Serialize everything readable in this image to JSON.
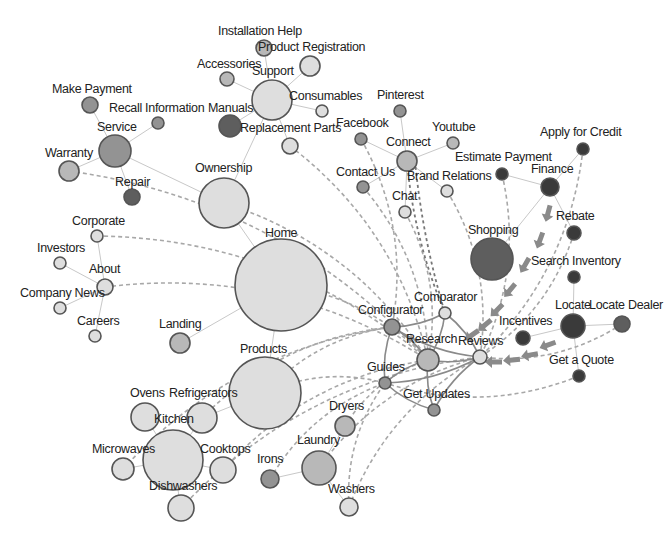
{
  "colors": {
    "light": "#dedede",
    "mid": "#b8b8b8",
    "midDark": "#939393",
    "dark": "#5e5e5e",
    "darkest": "#3a3a3a",
    "stroke": "#555555",
    "edge": "#c8c8c8",
    "dashed": "#a8a8a8"
  },
  "nodes": [
    {
      "id": "installation-help",
      "label": "Installation Help",
      "x": 264,
      "y": 48,
      "r": 8,
      "shade": "mid",
      "lx": 218,
      "ly": 35
    },
    {
      "id": "product-registration",
      "label": "Product Registration",
      "x": 310,
      "y": 66,
      "r": 10,
      "shade": "light",
      "lx": 258,
      "ly": 51
    },
    {
      "id": "accessories",
      "label": "Accessories",
      "x": 227,
      "y": 79,
      "r": 7,
      "shade": "mid",
      "lx": 197,
      "ly": 68
    },
    {
      "id": "support",
      "label": "Support",
      "x": 272,
      "y": 100,
      "r": 20,
      "shade": "light",
      "lx": 252,
      "ly": 75
    },
    {
      "id": "consumables",
      "label": "Consumables",
      "x": 322,
      "y": 111,
      "r": 6,
      "shade": "light",
      "lx": 289,
      "ly": 100
    },
    {
      "id": "manuals",
      "label": "Manuals",
      "x": 230,
      "y": 126,
      "r": 11,
      "shade": "dark",
      "lx": 208,
      "ly": 112
    },
    {
      "id": "replacement-parts",
      "label": "Replacement Parts",
      "x": 290,
      "y": 146,
      "r": 8,
      "shade": "light",
      "lx": 240,
      "ly": 132
    },
    {
      "id": "make-payment",
      "label": "Make Payment",
      "x": 90,
      "y": 105,
      "r": 8,
      "shade": "midDark",
      "lx": 52,
      "ly": 93
    },
    {
      "id": "recall-information",
      "label": "Recall Information",
      "x": 158,
      "y": 123,
      "r": 6,
      "shade": "midDark",
      "lx": 109,
      "ly": 112
    },
    {
      "id": "service",
      "label": "Service",
      "x": 115,
      "y": 151,
      "r": 16,
      "shade": "midDark",
      "lx": 97,
      "ly": 131
    },
    {
      "id": "warranty",
      "label": "Warranty",
      "x": 69,
      "y": 171,
      "r": 10,
      "shade": "mid",
      "lx": 45,
      "ly": 157
    },
    {
      "id": "repair",
      "label": "Repair",
      "x": 132,
      "y": 197,
      "r": 8,
      "shade": "dark",
      "lx": 115,
      "ly": 186
    },
    {
      "id": "ownership",
      "label": "Ownership",
      "x": 224,
      "y": 203,
      "r": 25,
      "shade": "light",
      "lx": 195,
      "ly": 172
    },
    {
      "id": "corporate",
      "label": "Corporate",
      "x": 97,
      "y": 236,
      "r": 6,
      "shade": "light",
      "lx": 72,
      "ly": 225
    },
    {
      "id": "investors",
      "label": "Investors",
      "x": 60,
      "y": 263,
      "r": 6,
      "shade": "light",
      "lx": 37,
      "ly": 252
    },
    {
      "id": "about",
      "label": "About",
      "x": 105,
      "y": 287,
      "r": 8,
      "shade": "light",
      "lx": 89,
      "ly": 273
    },
    {
      "id": "company-news",
      "label": "Company News",
      "x": 60,
      "y": 308,
      "r": 6,
      "shade": "light",
      "lx": 20,
      "ly": 297
    },
    {
      "id": "careers",
      "label": "Careers",
      "x": 95,
      "y": 336,
      "r": 6,
      "shade": "light",
      "lx": 77,
      "ly": 325
    },
    {
      "id": "home",
      "label": "Home",
      "x": 281,
      "y": 285,
      "r": 46,
      "shade": "light",
      "lx": 265,
      "ly": 237
    },
    {
      "id": "landing",
      "label": "Landing",
      "x": 180,
      "y": 343,
      "r": 10,
      "shade": "mid",
      "lx": 159,
      "ly": 328
    },
    {
      "id": "products",
      "label": "Products",
      "x": 265,
      "y": 393,
      "r": 36,
      "shade": "light",
      "lx": 240,
      "ly": 353
    },
    {
      "id": "ovens",
      "label": "Ovens",
      "x": 145,
      "y": 417,
      "r": 14,
      "shade": "light",
      "lx": 130,
      "ly": 397
    },
    {
      "id": "refrigerators",
      "label": "Refrigerators",
      "x": 202,
      "y": 418,
      "r": 15,
      "shade": "light",
      "lx": 169,
      "ly": 397
    },
    {
      "id": "kitchen",
      "label": "Kitchen",
      "x": 173,
      "y": 460,
      "r": 30,
      "shade": "light",
      "lx": 154,
      "ly": 423
    },
    {
      "id": "microwaves",
      "label": "Microwaves",
      "x": 123,
      "y": 469,
      "r": 11,
      "shade": "light",
      "lx": 92,
      "ly": 453
    },
    {
      "id": "cooktops",
      "label": "Cooktops",
      "x": 223,
      "y": 470,
      "r": 13,
      "shade": "light",
      "lx": 200,
      "ly": 453
    },
    {
      "id": "irons",
      "label": "Irons",
      "x": 270,
      "y": 479,
      "r": 9,
      "shade": "midDark",
      "lx": 257,
      "ly": 463
    },
    {
      "id": "dishwashers",
      "label": "Dishwashers",
      "x": 181,
      "y": 508,
      "r": 13,
      "shade": "light",
      "lx": 149,
      "ly": 490
    },
    {
      "id": "laundry",
      "label": "Laundry",
      "x": 319,
      "y": 468,
      "r": 17,
      "shade": "mid",
      "lx": 297,
      "ly": 444
    },
    {
      "id": "dryers",
      "label": "Dryers",
      "x": 345,
      "y": 426,
      "r": 10,
      "shade": "mid",
      "lx": 329,
      "ly": 410
    },
    {
      "id": "washers",
      "label": "Washers",
      "x": 349,
      "y": 507,
      "r": 9,
      "shade": "light",
      "lx": 328,
      "ly": 493
    },
    {
      "id": "pinterest",
      "label": "Pinterest",
      "x": 400,
      "y": 111,
      "r": 6,
      "shade": "midDark",
      "lx": 377,
      "ly": 99
    },
    {
      "id": "facebook",
      "label": "Facebook",
      "x": 361,
      "y": 139,
      "r": 6,
      "shade": "midDark",
      "lx": 336,
      "ly": 127
    },
    {
      "id": "youtube",
      "label": "Youtube",
      "x": 453,
      "y": 143,
      "r": 6,
      "shade": "mid",
      "lx": 432,
      "ly": 131
    },
    {
      "id": "connect",
      "label": "Connect",
      "x": 407,
      "y": 161,
      "r": 10,
      "shade": "mid",
      "lx": 386,
      "ly": 146
    },
    {
      "id": "contact-us",
      "label": "Contact Us",
      "x": 363,
      "y": 187,
      "r": 6,
      "shade": "midDark",
      "lx": 336,
      "ly": 176
    },
    {
      "id": "brand-relations",
      "label": "Brand Relations",
      "x": 447,
      "y": 191,
      "r": 6,
      "shade": "light",
      "lx": 407,
      "ly": 180
    },
    {
      "id": "chat",
      "label": "Chat",
      "x": 405,
      "y": 212,
      "r": 6,
      "shade": "light",
      "lx": 392,
      "ly": 200
    },
    {
      "id": "estimate-payment",
      "label": "Estimate Payment",
      "x": 502,
      "y": 174,
      "r": 6,
      "shade": "darkest",
      "lx": 455,
      "ly": 161
    },
    {
      "id": "finance",
      "label": "Finance",
      "x": 550,
      "y": 187,
      "r": 9,
      "shade": "darkest",
      "lx": 531,
      "ly": 173
    },
    {
      "id": "apply-for-credit",
      "label": "Apply for Credit",
      "x": 583,
      "y": 149,
      "r": 6,
      "shade": "darkest",
      "lx": 540,
      "ly": 136
    },
    {
      "id": "shopping",
      "label": "Shopping",
      "x": 492,
      "y": 259,
      "r": 21,
      "shade": "dark",
      "lx": 468,
      "ly": 234
    },
    {
      "id": "rebate",
      "label": "Rebate",
      "x": 574,
      "y": 233,
      "r": 7,
      "shade": "darkest",
      "lx": 556,
      "ly": 220
    },
    {
      "id": "search-inventory",
      "label": "Search Inventory",
      "x": 574,
      "y": 277,
      "r": 6,
      "shade": "darkest",
      "lx": 531,
      "ly": 265
    },
    {
      "id": "locate",
      "label": "Locate",
      "x": 573,
      "y": 326,
      "r": 12,
      "shade": "darkest",
      "lx": 555,
      "ly": 309
    },
    {
      "id": "locate-dealer",
      "label": "Locate Dealer",
      "x": 622,
      "y": 324,
      "r": 8,
      "shade": "dark",
      "lx": 589,
      "ly": 309
    },
    {
      "id": "incentives",
      "label": "Incentives",
      "x": 523,
      "y": 338,
      "r": 7,
      "shade": "darkest",
      "lx": 499,
      "ly": 325
    },
    {
      "id": "get-a-quote",
      "label": "Get a Quote",
      "x": 579,
      "y": 376,
      "r": 6,
      "shade": "darkest",
      "lx": 549,
      "ly": 364
    },
    {
      "id": "comparator",
      "label": "Comparator",
      "x": 445,
      "y": 313,
      "r": 6,
      "shade": "light",
      "lx": 414,
      "ly": 301
    },
    {
      "id": "configurator",
      "label": "Configurator",
      "x": 392,
      "y": 327,
      "r": 8,
      "shade": "midDark",
      "lx": 358,
      "ly": 314
    },
    {
      "id": "research",
      "label": "Research",
      "x": 428,
      "y": 360,
      "r": 11,
      "shade": "mid",
      "lx": 406,
      "ly": 343
    },
    {
      "id": "reviews",
      "label": "Reviews",
      "x": 480,
      "y": 357,
      "r": 7,
      "shade": "light",
      "lx": 458,
      "ly": 345
    },
    {
      "id": "guides",
      "label": "Guides",
      "x": 385,
      "y": 383,
      "r": 6,
      "shade": "midDark",
      "lx": 367,
      "ly": 371
    },
    {
      "id": "get-updates",
      "label": "Get Updates",
      "x": 434,
      "y": 410,
      "r": 6,
      "shade": "midDark",
      "lx": 403,
      "ly": 398
    }
  ],
  "edges": [
    [
      "support",
      "installation-help"
    ],
    [
      "support",
      "product-registration"
    ],
    [
      "support",
      "accessories"
    ],
    [
      "support",
      "consumables"
    ],
    [
      "support",
      "manuals"
    ],
    [
      "support",
      "replacement-parts"
    ],
    [
      "ownership",
      "support"
    ],
    [
      "ownership",
      "service"
    ],
    [
      "service",
      "make-payment"
    ],
    [
      "service",
      "recall-information"
    ],
    [
      "service",
      "warranty"
    ],
    [
      "service",
      "repair"
    ],
    [
      "home",
      "ownership"
    ],
    [
      "home",
      "landing"
    ],
    [
      "home",
      "products"
    ],
    [
      "about",
      "corporate"
    ],
    [
      "about",
      "investors"
    ],
    [
      "about",
      "company-news"
    ],
    [
      "about",
      "careers"
    ],
    [
      "connect",
      "pinterest"
    ],
    [
      "connect",
      "facebook"
    ],
    [
      "connect",
      "youtube"
    ],
    [
      "connect",
      "contact-us"
    ],
    [
      "connect",
      "brand-relations"
    ],
    [
      "connect",
      "chat"
    ],
    [
      "finance",
      "estimate-payment"
    ],
    [
      "finance",
      "apply-for-credit"
    ],
    [
      "finance",
      "rebate"
    ],
    [
      "shopping",
      "finance"
    ],
    [
      "locate",
      "search-inventory"
    ],
    [
      "locate",
      "locate-dealer"
    ],
    [
      "locate",
      "get-a-quote"
    ],
    [
      "locate",
      "incentives"
    ],
    [
      "products",
      "refrigerators"
    ],
    [
      "refrigerators",
      "kitchen"
    ],
    [
      "ovens",
      "kitchen"
    ],
    [
      "microwaves",
      "kitchen"
    ],
    [
      "kitchen",
      "cooktops"
    ],
    [
      "kitchen",
      "dishwashers"
    ],
    [
      "laundry",
      "irons"
    ],
    [
      "laundry",
      "dryers"
    ],
    [
      "laundry",
      "washers"
    ]
  ],
  "hub_edges": [
    [
      "research",
      "configurator"
    ],
    [
      "research",
      "comparator"
    ],
    [
      "research",
      "reviews"
    ],
    [
      "research",
      "guides"
    ],
    [
      "research",
      "get-updates"
    ],
    [
      "configurator",
      "comparator"
    ],
    [
      "configurator",
      "guides"
    ],
    [
      "reviews",
      "comparator"
    ],
    [
      "reviews",
      "get-updates"
    ],
    [
      "guides",
      "get-updates"
    ],
    [
      "configurator",
      "reviews"
    ],
    [
      "guides",
      "reviews"
    ]
  ],
  "dashed_edges": [
    [
      "warranty",
      "research"
    ],
    [
      "ownership",
      "research"
    ],
    [
      "corporate",
      "research"
    ],
    [
      "about",
      "research"
    ],
    [
      "home",
      "research"
    ],
    [
      "replacement-parts",
      "research"
    ],
    [
      "facebook",
      "configurator"
    ],
    [
      "contact-us",
      "research"
    ],
    [
      "chat",
      "research"
    ],
    [
      "brand-relations",
      "reviews"
    ],
    [
      "estimate-payment",
      "reviews"
    ],
    [
      "apply-for-credit",
      "reviews"
    ],
    [
      "rebate",
      "reviews"
    ],
    [
      "locate-dealer",
      "reviews"
    ],
    [
      "get-a-quote",
      "guides"
    ],
    [
      "refrigerators",
      "configurator"
    ],
    [
      "products",
      "configurator"
    ],
    [
      "products",
      "guides"
    ],
    [
      "cooktops",
      "research"
    ],
    [
      "dishwashers",
      "reviews"
    ],
    [
      "irons",
      "guides"
    ],
    [
      "dryers",
      "research"
    ],
    [
      "laundry",
      "reviews"
    ],
    [
      "washers",
      "guides"
    ],
    [
      "washers",
      "reviews"
    ],
    [
      "microwaves",
      "configurator"
    ]
  ],
  "dark_dashed_edges": [
    [
      "connect",
      "comparator"
    ]
  ],
  "arrows": [
    {
      "x": 548,
      "y": 213,
      "angle": 105
    },
    {
      "x": 540,
      "y": 240,
      "angle": 110
    },
    {
      "x": 525,
      "y": 265,
      "angle": 120
    },
    {
      "x": 510,
      "y": 290,
      "angle": 130
    },
    {
      "x": 497,
      "y": 310,
      "angle": 135
    },
    {
      "x": 485,
      "y": 325,
      "angle": 140
    },
    {
      "x": 472,
      "y": 335,
      "angle": 145
    },
    {
      "x": 548,
      "y": 345,
      "angle": 160
    },
    {
      "x": 530,
      "y": 355,
      "angle": 170
    },
    {
      "x": 512,
      "y": 360,
      "angle": 175
    },
    {
      "x": 494,
      "y": 362,
      "angle": 180
    }
  ]
}
